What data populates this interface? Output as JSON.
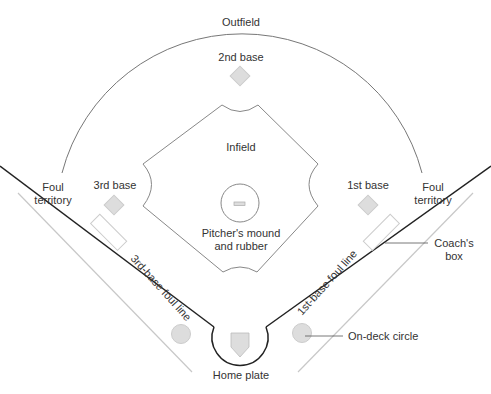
{
  "diagram": {
    "labels": {
      "outfield": "Outfield",
      "second_base": "2nd base",
      "infield": "Infield",
      "third_base": "3rd base",
      "first_base": "1st base",
      "pitcher_line1": "Pitcher's mound",
      "pitcher_line2": "and rubber",
      "foul_left_line1": "Foul",
      "foul_left_line2": "territory",
      "foul_right_line1": "Foul",
      "foul_right_line2": "territory",
      "coach_line1": "Coach's",
      "coach_line2": "box",
      "third_foul_line": "3rd-base foul line",
      "first_foul_line": "1st-base foul line",
      "on_deck": "On-deck circle",
      "home_plate": "Home plate"
    },
    "colors": {
      "line_dark": "#222222",
      "line_mid": "#777777",
      "line_light": "#c8c8c8",
      "fill_gray": "#dddddd",
      "text": "#333333"
    }
  }
}
